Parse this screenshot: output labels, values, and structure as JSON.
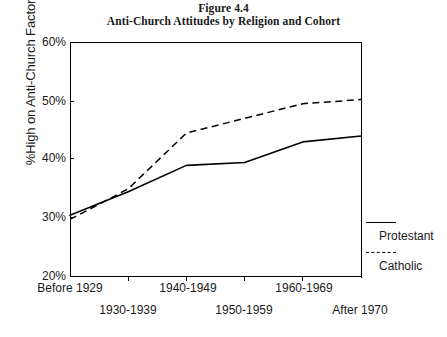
{
  "title": {
    "line1": "Figure 4.4",
    "line2": "Anti-Church Attitudes by Religion and Cohort"
  },
  "axes": {
    "ylabel": "%High on Anti-Church Factor",
    "yticks": [
      "20%",
      "30%",
      "40%",
      "50%",
      "60%"
    ],
    "xticks": [
      "Before 1929",
      "1930-1939",
      "1940-1949",
      "1950-1959",
      "1960-1969",
      "After 1970"
    ]
  },
  "legend": {
    "protestant": "Protestant",
    "catholic": "Catholic"
  },
  "colors": {
    "line": "#000000",
    "axis": "#000000",
    "background": "#ffffff"
  },
  "chart_data": {
    "type": "line",
    "title": "Anti-Church Attitudes by Religion and Cohort",
    "subtitle": "Figure 4.4",
    "xlabel": "",
    "ylabel": "%High on Anti-Church Factor",
    "categories": [
      "Before 1929",
      "1930-1939",
      "1940-1949",
      "1950-1959",
      "1960-1969",
      "After 1970"
    ],
    "series": [
      {
        "name": "Protestant",
        "style": "solid",
        "values": [
          30.5,
          34.5,
          39.0,
          39.5,
          43.0,
          44.0
        ]
      },
      {
        "name": "Catholic",
        "style": "dashed",
        "values": [
          29.8,
          35.0,
          44.5,
          47.0,
          49.5,
          50.2
        ]
      }
    ],
    "ylim": [
      20,
      60
    ],
    "ytick_values": [
      20,
      30,
      40,
      50,
      60
    ],
    "grid": false,
    "legend_position": "right"
  }
}
